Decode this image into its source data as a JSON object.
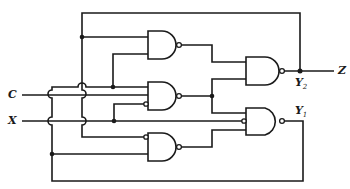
{
  "diagram": {
    "type": "sequential logic circuit (NAND gates with feedback)",
    "inputs": [
      {
        "id": "C",
        "label": "C"
      },
      {
        "id": "X",
        "label": "X"
      }
    ],
    "outputs": [
      {
        "id": "Z",
        "label": "Z"
      }
    ],
    "state_labels": {
      "y2": {
        "main": "Y",
        "sub": "2"
      },
      "y1": {
        "main": "Y",
        "sub": "1"
      }
    },
    "gates": [
      {
        "id": "g1",
        "type": "NAND",
        "inputs": [
          "y2_feedback",
          "y1_feedback"
        ]
      },
      {
        "id": "g2",
        "type": "NAND",
        "inputs": [
          "y1_feedback",
          "C",
          "NOT X"
        ]
      },
      {
        "id": "g3",
        "type": "NAND",
        "inputs": [
          "NOT y2_feedback",
          "y1_feedback"
        ]
      },
      {
        "id": "g4",
        "type": "NAND",
        "inputs": [
          "g1",
          "g2"
        ],
        "output": "Y2"
      },
      {
        "id": "g5",
        "type": "NAND",
        "inputs": [
          "g2",
          "NOT X",
          "g3"
        ],
        "output": "Y1"
      }
    ],
    "colors": {
      "line": "#1a1a1a",
      "background": "#ffffff"
    }
  }
}
